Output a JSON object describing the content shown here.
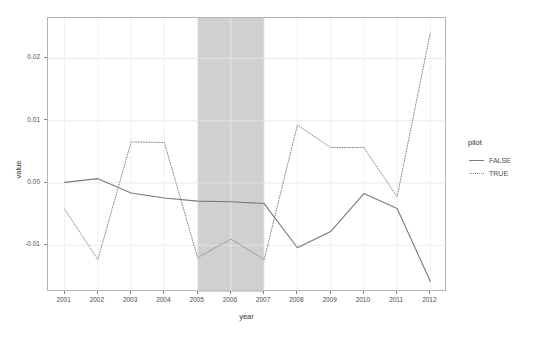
{
  "chart_data": {
    "type": "line",
    "title": "",
    "xlabel": "year",
    "ylabel": "value",
    "x": [
      2001,
      2002,
      2003,
      2004,
      2005,
      2006,
      2007,
      2008,
      2009,
      2010,
      2011,
      2012
    ],
    "xticklabels": [
      "2001",
      "2002",
      "2003",
      "2004",
      "2005",
      "2006",
      "2007",
      "2008",
      "2009",
      "2010",
      "2011",
      "2012"
    ],
    "yticklabels": [
      "0.02",
      "0.01",
      "0.00",
      "-0.01"
    ],
    "ytickvalues": [
      0.02,
      0.01,
      0.0,
      -0.01
    ],
    "xlim": [
      2000.5,
      2012.5
    ],
    "ylim": [
      -0.0175,
      0.0265
    ],
    "grid": true,
    "legend_position": "right",
    "legend": {
      "title": "pilot",
      "entries": [
        {
          "label": "FALSE",
          "style": "solid",
          "color": "#7a7a7a"
        },
        {
          "label": "TRUE",
          "style": "dotted",
          "color": "#8a8a8a"
        }
      ]
    },
    "series": [
      {
        "name": "FALSE",
        "style": "solid",
        "color": "#7a7a7a",
        "values": [
          0.0001,
          0.0007,
          -0.0016,
          -0.0024,
          -0.0029,
          -0.003,
          -0.0033,
          -0.0104,
          -0.0078,
          -0.0017,
          -0.0041,
          -0.0158
        ]
      },
      {
        "name": "TRUE",
        "style": "dotted",
        "color": "#8a8a8a",
        "values": [
          -0.0042,
          -0.0123,
          0.0066,
          0.0065,
          -0.012,
          -0.009,
          -0.0123,
          0.0093,
          0.0057,
          0.0057,
          -0.0022,
          0.0242
        ]
      }
    ],
    "annotations": [
      {
        "type": "shaded-band",
        "name": "highlight-band",
        "x_start": 2005,
        "x_end": 2007,
        "color": "#c8c8c8"
      }
    ]
  }
}
